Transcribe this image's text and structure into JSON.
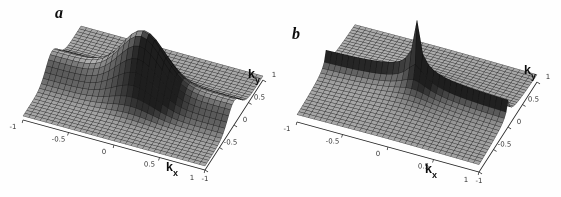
{
  "figure": {
    "background": "#fefefe",
    "panels": [
      {
        "label": "a",
        "x_axis": {
          "label_base": "k",
          "label_sub": "x",
          "ticks": [
            "-1",
            "-0.5",
            "0",
            "0.5",
            "1"
          ]
        },
        "y_axis": {
          "label_base": "k",
          "label_sub": "y",
          "ticks": [
            "-1",
            "-0.5",
            "0",
            "0.5",
            "1"
          ]
        },
        "surface": {
          "style": "smooth",
          "base": 0.08,
          "ridge": {
            "along": "ky=0",
            "height": 0.4,
            "width": 0.3,
            "profile": "gaussian"
          },
          "peak": {
            "center": [
              0,
              0
            ],
            "height": 0.9,
            "width": 0.32,
            "profile": "gaussian"
          },
          "grid_divisions": 32,
          "k_min": -1,
          "k_max": 1
        }
      },
      {
        "label": "b",
        "x_axis": {
          "label_base": "k",
          "label_sub": "x",
          "ticks": [
            "-1",
            "-0.5",
            "0",
            "0.5",
            "1"
          ]
        },
        "y_axis": {
          "label_base": "k",
          "label_sub": "y",
          "ticks": [
            "-1",
            "-0.5",
            "0",
            "0.5",
            "1"
          ]
        },
        "surface": {
          "style": "sharp",
          "base": 0.08,
          "ridge": {
            "along": "ky=0",
            "height": 0.4,
            "width": 0.075,
            "profile": "cusp"
          },
          "peak": {
            "center": [
              0,
              0
            ],
            "height": 1.15,
            "width": 0.05,
            "profile": "cusp"
          },
          "grid_divisions": 32,
          "k_min": -1,
          "k_max": 1
        }
      }
    ],
    "style": {
      "mesh_line_color": "rgba(12,12,12,0.72)",
      "axis_line_color": "#222222",
      "tick_color": "#3a3a3a",
      "label_color": "#0d0d0d",
      "light_direction": [
        -0.5,
        0.2,
        0.84
      ],
      "shade_min_gray": 30,
      "shade_max_gray": 212
    }
  },
  "chart_data": [
    {
      "type": "surface",
      "panel": "a",
      "xlabel": "k_x",
      "ylabel": "k_y",
      "x_range": [
        -1,
        1
      ],
      "y_range": [
        -1,
        1
      ],
      "x_ticks": [
        -1,
        -0.5,
        0,
        0.5,
        1
      ],
      "y_ticks": [
        -1,
        -0.5,
        0,
        0.5,
        1
      ],
      "description": "Smooth gray wireframe mesh: broad rounded dome at k=0 sitting on a soft ridge running along ky=0; flat low plateaus elsewhere.",
      "z_model": "z = 0.08 + 0.40*exp(-(ky/0.30)^2) + 0.90*exp(-((kx^2+ky^2)/0.32^2))",
      "x_sample": [
        -1,
        -0.5,
        0,
        0.5,
        1
      ],
      "y_sample": [
        -1,
        -0.5,
        0,
        0.5,
        1
      ],
      "z_grid_estimate": [
        [
          0.08,
          0.08,
          0.08,
          0.08,
          0.08
        ],
        [
          0.11,
          0.11,
          0.18,
          0.11,
          0.11
        ],
        [
          0.48,
          0.56,
          1.38,
          0.56,
          0.48
        ],
        [
          0.11,
          0.11,
          0.18,
          0.11,
          0.11
        ],
        [
          0.08,
          0.08,
          0.08,
          0.08,
          0.08
        ]
      ]
    },
    {
      "type": "surface",
      "panel": "b",
      "xlabel": "k_x",
      "ylabel": "k_y",
      "x_range": [
        -1,
        1
      ],
      "y_range": [
        -1,
        1
      ],
      "x_ticks": [
        -1,
        -0.5,
        0,
        0.5,
        1
      ],
      "y_ticks": [
        -1,
        -0.5,
        0,
        0.5,
        1
      ],
      "description": "Same layout as panel a but singular: tall narrow needle spike at k=0 on a sharp cusped ridge along ky=0; flat plateaus elsewhere.",
      "z_model": "z = 0.08 + 0.40*0.075/(|ky|+0.075) + 1.15*0.05/(sqrt(kx^2+ky^2)+0.05)",
      "x_sample": [
        -1,
        -0.5,
        0,
        0.5,
        1
      ],
      "y_sample": [
        -1,
        -0.5,
        0,
        0.5,
        1
      ],
      "z_grid_estimate": [
        [
          0.15,
          0.16,
          0.16,
          0.16,
          0.15
        ],
        [
          0.18,
          0.21,
          0.24,
          0.21,
          0.18
        ],
        [
          0.54,
          0.59,
          1.63,
          0.59,
          0.54
        ],
        [
          0.18,
          0.21,
          0.24,
          0.21,
          0.18
        ],
        [
          0.15,
          0.16,
          0.16,
          0.16,
          0.15
        ]
      ]
    }
  ]
}
